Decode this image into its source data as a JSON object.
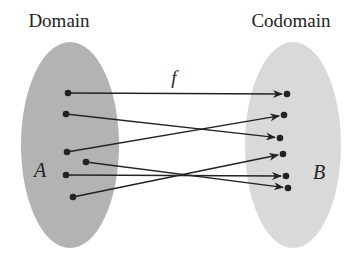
{
  "diagram": {
    "type": "function-mapping",
    "function_label": "f",
    "colors": {
      "background": "#ffffff",
      "domain_fill": "#b3b3b3",
      "codomain_fill": "#d9d9d9",
      "ink": "#222222"
    },
    "domain": {
      "title": "Domain",
      "set_name": "A",
      "ellipse": {
        "cx": 70,
        "cy": 145,
        "rx": 49,
        "ry": 103
      },
      "elements": [
        {
          "id": "a1",
          "x": 68,
          "y": 93
        },
        {
          "id": "a2",
          "x": 66,
          "y": 114
        },
        {
          "id": "a3",
          "x": 67,
          "y": 152
        },
        {
          "id": "a4",
          "x": 86,
          "y": 162
        },
        {
          "id": "a5",
          "x": 66,
          "y": 175
        },
        {
          "id": "a6",
          "x": 73,
          "y": 197
        }
      ]
    },
    "codomain": {
      "title": "Codomain",
      "set_name": "B",
      "ellipse": {
        "cx": 293,
        "cy": 145,
        "rx": 48,
        "ry": 103
      },
      "elements": [
        {
          "id": "b1",
          "x": 287,
          "y": 94
        },
        {
          "id": "b2",
          "x": 284,
          "y": 115
        },
        {
          "id": "b3",
          "x": 280,
          "y": 138
        },
        {
          "id": "b4",
          "x": 283,
          "y": 154
        },
        {
          "id": "b5",
          "x": 286,
          "y": 176
        },
        {
          "id": "b6",
          "x": 288,
          "y": 188
        }
      ]
    },
    "mappings": [
      {
        "from": "a1",
        "to": "b1"
      },
      {
        "from": "a2",
        "to": "b3"
      },
      {
        "from": "a3",
        "to": "b2"
      },
      {
        "from": "a4",
        "to": "b6"
      },
      {
        "from": "a5",
        "to": "b5"
      },
      {
        "from": "a6",
        "to": "b4"
      }
    ]
  }
}
